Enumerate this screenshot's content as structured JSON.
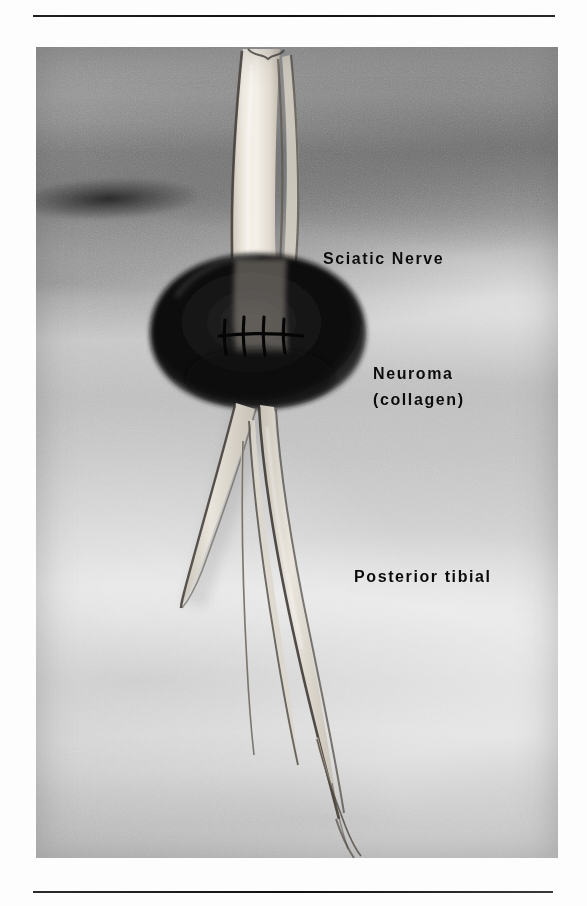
{
  "figure": {
    "kind": "anatomical-photograph",
    "plate": {
      "background_tone": "#bdbdbd",
      "nerve_tone": "#e8e4dc",
      "neuroma_tone": "#1a1a1a",
      "outline_tone": "#3a3a3a"
    }
  },
  "labels": {
    "sciatic_nerve": "Sciatic Nerve",
    "neuroma": "Neuroma",
    "collagen": "(collagen)",
    "posterior_tibial": "Posterior tibial"
  },
  "annotations": {
    "suture_count": 4,
    "suture_line": "horizontal closure across neuroma",
    "branch_count": 4
  },
  "rules": {
    "top": "horizontal-rule",
    "bottom": "horizontal-rule"
  }
}
